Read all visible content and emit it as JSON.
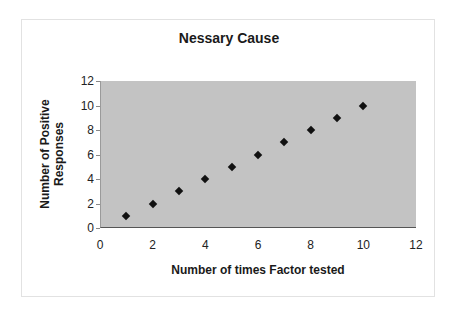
{
  "chart_data": {
    "type": "scatter",
    "title": "Nessary Cause",
    "xlabel": "Number of times Factor tested",
    "ylabel_line1": "Number of Positive",
    "ylabel_line2": "Responses",
    "x": [
      1,
      2,
      3,
      4,
      5,
      6,
      7,
      8,
      9,
      10
    ],
    "y": [
      1,
      2,
      3,
      4,
      5,
      6,
      7,
      8,
      9,
      10
    ],
    "xlim": [
      0,
      12
    ],
    "ylim": [
      0,
      12
    ],
    "xticks": [
      "0",
      "2",
      "4",
      "6",
      "8",
      "10",
      "12"
    ],
    "yticks": [
      "0",
      "2",
      "4",
      "6",
      "8",
      "10",
      "12"
    ],
    "grid": false,
    "legend": null,
    "marker": "diamond",
    "marker_color": "#111111",
    "plot_background": "#c3c3c3"
  }
}
